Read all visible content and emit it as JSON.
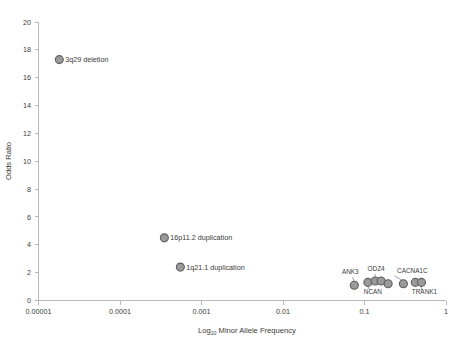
{
  "chart_data": {
    "type": "scatter",
    "title": "",
    "xlabel": "Log10 Minor Allele Frequency",
    "xlabel_main": "Log",
    "xlabel_sub": "10",
    "xlabel_rest": " Minor Allele Frequency",
    "ylabel": "Odds Ratio",
    "xscale": "log",
    "xlim": [
      1e-05,
      1
    ],
    "ylim": [
      0,
      20
    ],
    "grid": false,
    "legend": "none",
    "xticks": [
      1e-05,
      0.0001,
      0.001,
      0.01,
      0.1,
      1
    ],
    "xtick_labels": [
      "0.00001",
      "0.0001",
      "0.001",
      "0.01",
      "0.1",
      "1"
    ],
    "yticks": [
      0,
      2,
      4,
      6,
      8,
      10,
      12,
      14,
      16,
      18,
      20
    ],
    "ytick_labels": [
      "0",
      "2",
      "4",
      "6",
      "8",
      "10",
      "12",
      "14",
      "16",
      "18",
      "20"
    ],
    "marker_fill": "#9a9a9a",
    "marker_stroke": "#5f5f5f",
    "points": [
      {
        "name": "3q29 deletion",
        "x": 1.8e-05,
        "y": 17.3,
        "label": "3q29 deletion",
        "label_pos": "right",
        "label_style": "plain"
      },
      {
        "name": "16p11.2 duplication",
        "x": 0.00035,
        "y": 4.5,
        "label": "16p11.2 duplication",
        "label_pos": "right",
        "label_style": "plain"
      },
      {
        "name": "1q21.1 duplication",
        "x": 0.00055,
        "y": 2.4,
        "label": "1q21.1 duplication",
        "label_pos": "right",
        "label_style": "plain"
      },
      {
        "name": "ANK3",
        "x": 0.075,
        "y": 1.1,
        "label": "ANK3",
        "label_pos": "above-left",
        "label_style": "gene"
      },
      {
        "name": "NCAN",
        "x": 0.11,
        "y": 1.3,
        "label": "NCAN",
        "label_pos": "below-left",
        "label_style": "gene"
      },
      {
        "name": "ODZ4",
        "x": 0.135,
        "y": 1.4,
        "label": "ODZ4",
        "label_pos": "above",
        "label_style": "gene"
      },
      {
        "name": "unlabeled-1",
        "x": 0.16,
        "y": 1.4,
        "label": "",
        "label_pos": "none",
        "label_style": "none"
      },
      {
        "name": "unlabeled-2",
        "x": 0.195,
        "y": 1.2,
        "label": "",
        "label_pos": "none",
        "label_style": "none"
      },
      {
        "name": "CACNA1C",
        "x": 0.3,
        "y": 1.2,
        "label": "CACNA1C",
        "label_pos": "above-right",
        "label_style": "gene"
      },
      {
        "name": "unlabeled-3",
        "x": 0.42,
        "y": 1.3,
        "label": "",
        "label_pos": "none",
        "label_style": "none"
      },
      {
        "name": "TRANK1",
        "x": 0.5,
        "y": 1.3,
        "label": "TRANK1",
        "label_pos": "below-right",
        "label_style": "gene"
      }
    ],
    "annotations": [
      {
        "text": "ANK3",
        "target": "ANK3",
        "leader": true
      },
      {
        "text": "NCAN",
        "target": "NCAN",
        "leader": true
      },
      {
        "text": "ODZ4",
        "target": "ODZ4",
        "leader": true
      },
      {
        "text": "CACNA1C",
        "target": "CACNA1C",
        "leader": true
      },
      {
        "text": "TRANK1",
        "target": "TRANK1",
        "leader": true
      }
    ]
  }
}
